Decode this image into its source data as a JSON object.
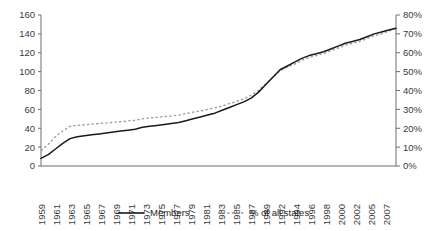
{
  "chart_data": {
    "type": "line",
    "title": "",
    "xlabel": "",
    "ylabel": "",
    "grid": false,
    "legend_position": "bottom",
    "x": [
      1959,
      1960,
      1961,
      1962,
      1963,
      1964,
      1965,
      1966,
      1967,
      1968,
      1969,
      1970,
      1971,
      1972,
      1973,
      1974,
      1975,
      1976,
      1977,
      1978,
      1979,
      1980,
      1981,
      1982,
      1983,
      1984,
      1985,
      1986,
      1987,
      1988,
      1989,
      1990,
      1991,
      1992,
      1993,
      1994,
      1995,
      1996,
      1997,
      1998,
      1999,
      2000,
      2001,
      2002,
      2003,
      2004,
      2005,
      2006,
      2007,
      2008
    ],
    "x_tick_labels": [
      "1959",
      "1961",
      "1963",
      "1965",
      "1967",
      "1969",
      "1971",
      "1973",
      "1975",
      "1977",
      "1979",
      "1981",
      "1983",
      "1985",
      "1987",
      "1989",
      "1992",
      "1994",
      "1996",
      "1998",
      "2000",
      "2002",
      "2005",
      "2007"
    ],
    "axes": {
      "left": {
        "name": "Members",
        "ticks": [
          0,
          20,
          40,
          60,
          80,
          100,
          120,
          140,
          160
        ],
        "tick_labels": [
          "0",
          "20",
          "40",
          "60",
          "80",
          "100",
          "120",
          "140",
          "160"
        ],
        "range": [
          0,
          160
        ]
      },
      "right": {
        "name": "% of all states",
        "ticks": [
          0,
          10,
          20,
          30,
          40,
          50,
          60,
          70,
          80
        ],
        "tick_labels": [
          "0%",
          "10%",
          "20%",
          "30%",
          "40%",
          "50%",
          "60%",
          "70%",
          "80%"
        ],
        "range": [
          0,
          80
        ]
      }
    },
    "series": [
      {
        "name": "Members",
        "axis": "left",
        "style": "solid",
        "color": "#1a1a1a",
        "values": [
          8,
          12,
          18,
          24,
          29,
          31,
          32,
          33,
          34,
          35,
          36,
          37,
          38,
          39,
          41,
          42,
          43,
          44,
          45,
          46,
          48,
          50,
          52,
          54,
          56,
          59,
          62,
          65,
          68,
          72,
          78,
          86,
          94,
          102,
          106,
          110,
          114,
          117,
          119,
          121,
          124,
          127,
          130,
          132,
          134,
          137,
          140,
          142,
          144,
          146
        ]
      },
      {
        "name": "% of all states",
        "axis": "right",
        "style": "dashed",
        "color": "#9a9a9a",
        "values": [
          8.0,
          11.5,
          15.5,
          18.5,
          21.0,
          21.5,
          21.8,
          22.2,
          22.5,
          22.8,
          23.2,
          23.5,
          23.9,
          24.2,
          25.0,
          25.4,
          25.8,
          26.2,
          26.5,
          27.0,
          27.8,
          28.5,
          29.2,
          30.0,
          30.8,
          31.8,
          33.0,
          34.2,
          35.5,
          37.5,
          40.0,
          43.5,
          47.0,
          50.5,
          52.5,
          54.0,
          56.0,
          57.5,
          58.5,
          59.5,
          61.0,
          62.5,
          64.0,
          65.0,
          66.0,
          67.5,
          69.0,
          70.0,
          71.5,
          73.0
        ]
      }
    ],
    "legend": [
      {
        "label": "Members",
        "style": "solid",
        "color": "#1a1a1a"
      },
      {
        "label": "% of all states",
        "style": "dashed",
        "color": "#9a9a9a"
      }
    ]
  },
  "colors": {
    "members_line": "#1a1a1a",
    "percent_line": "#9a9a9a",
    "axis": "#6e6e6e",
    "text": "#231f20",
    "background": "#ffffff"
  }
}
